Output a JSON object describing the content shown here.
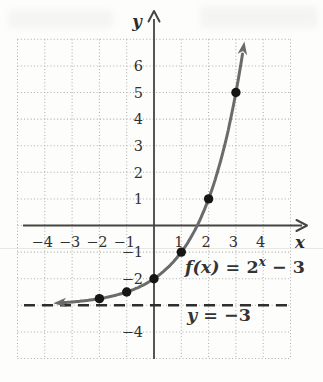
{
  "chart_data": {
    "type": "line",
    "function": "f(x) = 2^x − 3",
    "function_def": {
      "kind": "exponential",
      "base": 2,
      "offset": -3
    },
    "asymptote": {
      "y": -3,
      "label": "y = −3"
    },
    "x_range": [
      -5,
      5
    ],
    "y_range": [
      -5,
      7
    ],
    "grid": true,
    "curve_domain": [
      -3.36,
      3.26
    ],
    "x_ticks": [
      {
        "v": -4,
        "label": "−4"
      },
      {
        "v": -3,
        "label": "−3"
      },
      {
        "v": -2,
        "label": "−2"
      },
      {
        "v": -1,
        "label": "−1"
      },
      {
        "v": 1,
        "label": "1"
      },
      {
        "v": 2,
        "label": "2"
      },
      {
        "v": 3,
        "label": "3"
      },
      {
        "v": 4,
        "label": "4"
      }
    ],
    "y_ticks": [
      {
        "v": 6,
        "label": "6"
      },
      {
        "v": 5,
        "label": "5"
      },
      {
        "v": 4,
        "label": "4"
      },
      {
        "v": 3,
        "label": "3"
      },
      {
        "v": 2,
        "label": "2"
      },
      {
        "v": 1,
        "label": "1"
      },
      {
        "v": -1,
        "label": "−1"
      },
      {
        "v": -2,
        "label": "−2"
      },
      {
        "v": -4,
        "label": "−4"
      }
    ],
    "axis_labels": {
      "x": "x",
      "y": "y"
    },
    "points": [
      {
        "x": -2,
        "y": -2.75
      },
      {
        "x": -1,
        "y": -2.5
      },
      {
        "x": 0,
        "y": -2
      },
      {
        "x": 1,
        "y": -1
      },
      {
        "x": 2,
        "y": 1
      },
      {
        "x": 3,
        "y": 5
      }
    ],
    "labels": {
      "function": {
        "text": "f(x) = 2^x − 3",
        "segments": [
          {
            "t": "f(x)",
            "style": "italic"
          },
          {
            "t": " = 2",
            "style": "roman"
          },
          {
            "t": "x",
            "style": "italic-sup"
          },
          {
            "t": " − 3",
            "style": "roman"
          }
        ]
      },
      "asymptote": {
        "text": "y = −3",
        "segments": [
          {
            "t": "y",
            "style": "italic"
          },
          {
            "t": " = −3",
            "style": "roman"
          }
        ]
      }
    },
    "colors": {
      "curve": "#6b6b6b",
      "points": "#161616",
      "axes": "#454545",
      "grid": "#aeaeae",
      "asymptote": "#2e2e2e",
      "text": "#303030"
    }
  }
}
